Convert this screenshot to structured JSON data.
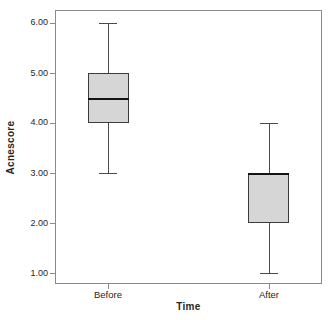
{
  "chart_data": {
    "type": "box",
    "title": "",
    "xlabel": "Time",
    "ylabel": "Acnescore",
    "categories": [
      "Before",
      "After"
    ],
    "boxes": [
      {
        "category": "Before",
        "whisker_low": 3.0,
        "q1": 4.0,
        "median": 4.5,
        "q3": 5.0,
        "whisker_high": 6.0
      },
      {
        "category": "After",
        "whisker_low": 1.0,
        "q1": 2.0,
        "median": 3.0,
        "q3": 3.0,
        "whisker_high": 4.0
      }
    ],
    "y_ticks": [
      {
        "value": 1.0,
        "label": "1.00"
      },
      {
        "value": 2.0,
        "label": "2.00"
      },
      {
        "value": 3.0,
        "label": "3.00"
      },
      {
        "value": 4.0,
        "label": "4.00"
      },
      {
        "value": 5.0,
        "label": "5.00"
      },
      {
        "value": 6.0,
        "label": "6.00"
      }
    ],
    "ylim": [
      0.78,
      6.26
    ],
    "grid": false,
    "legend_position": "none",
    "colors": {
      "box_fill": "#d6d6d6",
      "box_border": "#3c3c3c",
      "median": "#141414",
      "whisker": "#4a4a4a",
      "frame": "#8a8a8a",
      "text": "#262626",
      "background": "#ffffff"
    }
  }
}
